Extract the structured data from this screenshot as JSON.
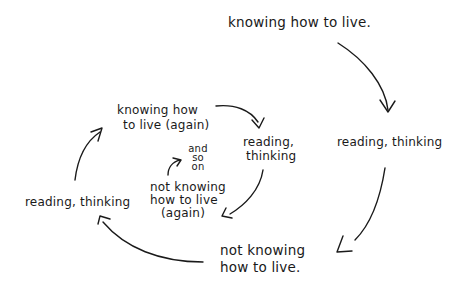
{
  "diagram": {
    "type": "hand-drawn cycle / spiral",
    "nodes": {
      "knowing": "knowing how to live.",
      "reading1": "reading, thinking",
      "not_knowing_1": "not knowing",
      "not_knowing_2": "how to live.",
      "reading2": "reading, thinking",
      "knowing_again_1": "knowing how",
      "knowing_again_2": "to live (again)",
      "reading3_1": "reading,",
      "reading3_2": "thinking",
      "not_knowing_again_1": "not knowing",
      "not_knowing_again_2": "how to live",
      "not_knowing_again_3": "(again)",
      "and_so_on_1": "and",
      "and_so_on_2": "so",
      "and_so_on_3": "on"
    },
    "edges": [
      {
        "from": "knowing how to live.",
        "to": "reading, thinking (right)"
      },
      {
        "from": "reading, thinking (right)",
        "to": "not knowing how to live."
      },
      {
        "from": "not knowing how to live.",
        "to": "reading, thinking (left)"
      },
      {
        "from": "reading, thinking (left)",
        "to": "knowing how to live (again)"
      },
      {
        "from": "knowing how to live (again)",
        "to": "reading, thinking (inner)"
      },
      {
        "from": "reading, thinking (inner)",
        "to": "not knowing how to live (again)"
      },
      {
        "from": "not knowing how to live (again)",
        "to": "and so on"
      }
    ],
    "ink_color": "#1a1a1a",
    "background": "#ffffff"
  }
}
